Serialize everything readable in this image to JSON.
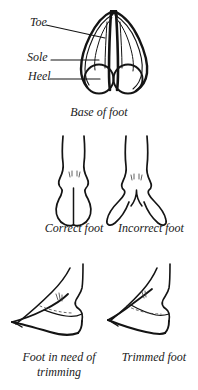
{
  "page": {
    "background_color": "#ffffff",
    "ink_color": "#141414",
    "width": 198,
    "height": 390
  },
  "figures": [
    {
      "id": "base-of-foot",
      "caption": "Base of foot",
      "annotations": [
        {
          "id": "toe",
          "label": "Toe"
        },
        {
          "id": "sole",
          "label": "Sole"
        },
        {
          "id": "heel",
          "label": "Heel"
        }
      ]
    },
    {
      "id": "foot-conformation",
      "items": [
        {
          "id": "correct-foot",
          "caption": "Correct foot"
        },
        {
          "id": "incorrect-foot",
          "caption": "Incorrect foot"
        }
      ]
    },
    {
      "id": "trimming-comparison",
      "items": [
        {
          "id": "untrimmed-foot",
          "caption_line_1": "Foot in need of",
          "caption_line_2": "trimming"
        },
        {
          "id": "trimmed-foot",
          "caption_line_1": "Trimmed foot",
          "caption_line_2": ""
        }
      ]
    }
  ],
  "annotation_labels": {
    "toe": "Toe",
    "sole": "Sole",
    "heel": "Heel"
  },
  "captions": {
    "base_of_foot": "Base of foot",
    "correct_foot": "Correct foot",
    "incorrect_foot": "Incorrect foot",
    "untrimmed_line1": "Foot in need of",
    "untrimmed_line2": "trimming",
    "trimmed_foot": "Trimmed foot"
  }
}
